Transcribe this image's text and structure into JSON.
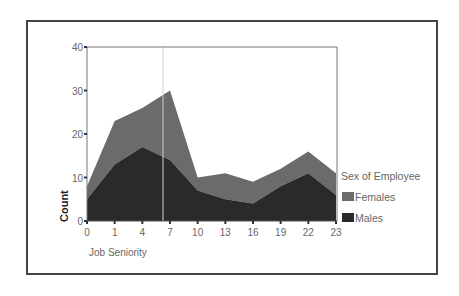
{
  "chart_data": {
    "type": "area",
    "stacked": true,
    "title": "",
    "xlabel": "Job Seniority",
    "ylabel": "Count",
    "x": [
      0,
      1,
      4,
      7,
      10,
      13,
      16,
      19,
      22,
      23
    ],
    "x_tick_labels": [
      "0",
      "1",
      "4",
      "7",
      "10",
      "13",
      "16",
      "19",
      "22",
      "23"
    ],
    "y_ticks": [
      0,
      10,
      20,
      30,
      40
    ],
    "ylim": [
      0,
      40
    ],
    "grid": false,
    "legend_title": "Sex of Employee",
    "legend_position": "right",
    "series": [
      {
        "name": "Females",
        "values": [
          3,
          10,
          9,
          16,
          3,
          6,
          5,
          4,
          5,
          5
        ],
        "color": "#6b6b6b"
      },
      {
        "name": "Males",
        "values": [
          5,
          13,
          17,
          14,
          7,
          5,
          4,
          8,
          11,
          6
        ],
        "color": "#2a2a2a"
      }
    ],
    "totals": [
      8,
      23,
      26,
      30,
      10,
      11,
      9,
      12,
      16,
      11
    ]
  }
}
